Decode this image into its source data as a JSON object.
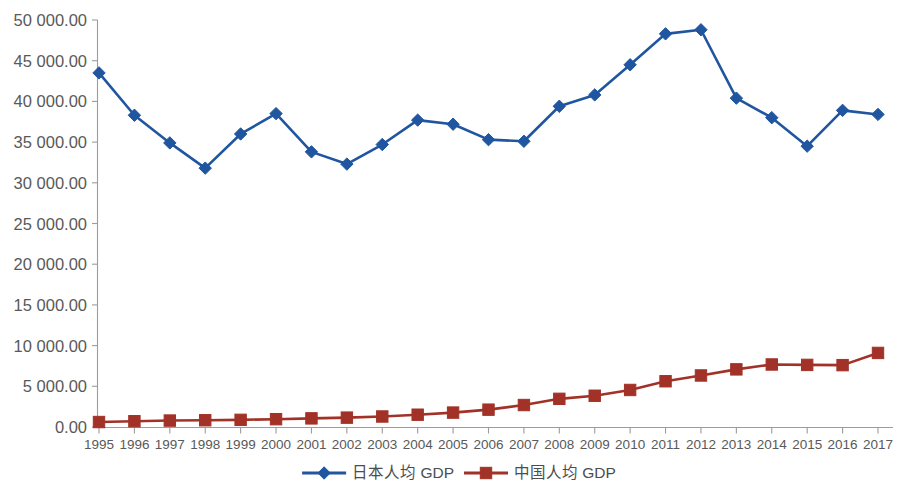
{
  "chart_data": {
    "type": "line",
    "title": "",
    "subtitle": "",
    "xlabel": "",
    "ylabel": "",
    "grid": false,
    "legend_position": "bottom",
    "categories": [
      "1995",
      "1996",
      "1997",
      "1998",
      "1999",
      "2000",
      "2001",
      "2002",
      "2003",
      "2004",
      "2005",
      "2006",
      "2007",
      "2008",
      "2009",
      "2010",
      "2011",
      "2012",
      "2013",
      "2014",
      "2015",
      "2016",
      "2017"
    ],
    "x": [
      1995,
      1996,
      1997,
      1998,
      1999,
      2000,
      2001,
      2002,
      2003,
      2004,
      2005,
      2006,
      2007,
      2008,
      2009,
      2010,
      2011,
      2012,
      2013,
      2014,
      2015,
      2016,
      2017
    ],
    "ylim": [
      0,
      50000
    ],
    "ytick_values": [
      0,
      5000,
      10000,
      15000,
      20000,
      25000,
      30000,
      35000,
      40000,
      45000,
      50000
    ],
    "ytick_labels": [
      "0.00",
      "5 000.00",
      "10 000.00",
      "15 000.00",
      "20 000.00",
      "25 000.00",
      "30 000.00",
      "35 000.00",
      "40 000.00",
      "45 000.00",
      "50 000.00"
    ],
    "series": [
      {
        "name": "日本人均 GDP",
        "color": "#20559F",
        "marker": "diamond",
        "values": [
          43500,
          38300,
          34900,
          31800,
          36000,
          38500,
          33800,
          32300,
          34700,
          37700,
          37200,
          35300,
          35100,
          39400,
          40800,
          44500,
          48300,
          48800,
          40400,
          38000,
          34500,
          38900,
          38400
        ]
      },
      {
        "name": "中国人均 GDP",
        "color": "#A23227",
        "marker": "square",
        "values": [
          610,
          710,
          790,
          830,
          880,
          960,
          1060,
          1150,
          1290,
          1510,
          1770,
          2130,
          2700,
          3460,
          3840,
          4550,
          5620,
          6330,
          7080,
          7680,
          7630,
          7600,
          9100
        ]
      }
    ]
  },
  "axes": {
    "y_axis_name": "y-axis",
    "x_axis_name": "x-axis"
  },
  "legend": {
    "items": [
      {
        "label": "日本人均 GDP",
        "color": "#20559F",
        "marker": "diamond"
      },
      {
        "label": "中国人均 GDP",
        "color": "#A23227",
        "marker": "square"
      }
    ]
  }
}
